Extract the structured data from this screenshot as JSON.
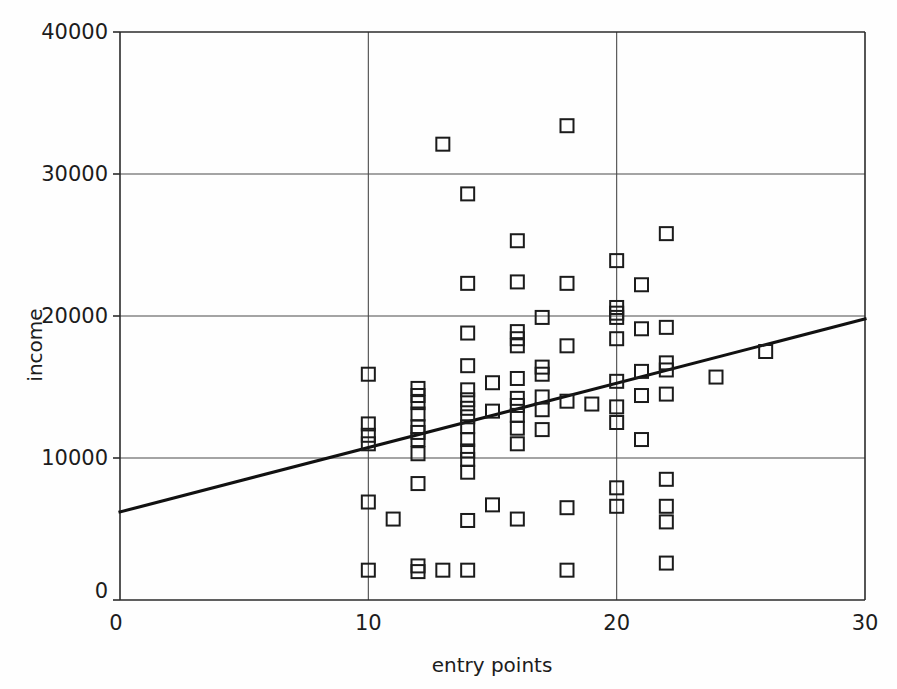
{
  "chart_data": {
    "type": "scatter",
    "title": "",
    "xlabel": "entry points",
    "ylabel": "income",
    "xlim": [
      0,
      30
    ],
    "ylim": [
      0,
      40000
    ],
    "xticks": [
      0,
      10,
      20,
      30
    ],
    "xtick_labels": [
      "0",
      "10",
      "20",
      "30"
    ],
    "yticks": [
      0,
      10000,
      20000,
      30000,
      40000
    ],
    "ytick_labels": [
      "0",
      "10000",
      "20000",
      "30000",
      "40000"
    ],
    "grid": true,
    "grid_description": "horizontal gridlines at 10000, 20000, 30000; vertical gridlines at 10 and 20",
    "legend": null,
    "marker_style": "open square",
    "series": [
      {
        "name": "observations",
        "points": [
          [
            10,
            2100
          ],
          [
            10,
            6900
          ],
          [
            10,
            11000
          ],
          [
            10,
            11600
          ],
          [
            10,
            12400
          ],
          [
            10,
            15900
          ],
          [
            11,
            5700
          ],
          [
            12,
            2000
          ],
          [
            12,
            2400
          ],
          [
            12,
            8200
          ],
          [
            12,
            10300
          ],
          [
            12,
            11300
          ],
          [
            12,
            11800
          ],
          [
            12,
            12200
          ],
          [
            12,
            13100
          ],
          [
            12,
            13900
          ],
          [
            12,
            14400
          ],
          [
            12,
            14900
          ],
          [
            13,
            2100
          ],
          [
            13,
            32100
          ],
          [
            14,
            2100
          ],
          [
            14,
            5600
          ],
          [
            14,
            9000
          ],
          [
            14,
            9900
          ],
          [
            14,
            10500
          ],
          [
            14,
            11300
          ],
          [
            14,
            12200
          ],
          [
            14,
            12900
          ],
          [
            14,
            13500
          ],
          [
            14,
            14100
          ],
          [
            14,
            14800
          ],
          [
            14,
            16500
          ],
          [
            14,
            18800
          ],
          [
            14,
            22300
          ],
          [
            14,
            28600
          ],
          [
            15,
            6700
          ],
          [
            15,
            13300
          ],
          [
            15,
            15300
          ],
          [
            16,
            5700
          ],
          [
            16,
            11000
          ],
          [
            16,
            12100
          ],
          [
            16,
            13000
          ],
          [
            16,
            13700
          ],
          [
            16,
            14200
          ],
          [
            16,
            15600
          ],
          [
            16,
            17900
          ],
          [
            16,
            18400
          ],
          [
            16,
            18900
          ],
          [
            16,
            22400
          ],
          [
            16,
            25300
          ],
          [
            17,
            12000
          ],
          [
            17,
            13400
          ],
          [
            17,
            14300
          ],
          [
            17,
            15900
          ],
          [
            17,
            16400
          ],
          [
            17,
            19900
          ],
          [
            18,
            2100
          ],
          [
            18,
            6500
          ],
          [
            18,
            14000
          ],
          [
            18,
            17900
          ],
          [
            18,
            22300
          ],
          [
            18,
            33400
          ],
          [
            19,
            13800
          ],
          [
            20,
            6600
          ],
          [
            20,
            7900
          ],
          [
            20,
            12500
          ],
          [
            20,
            13600
          ],
          [
            20,
            15400
          ],
          [
            20,
            18400
          ],
          [
            20,
            19900
          ],
          [
            20,
            20200
          ],
          [
            20,
            20600
          ],
          [
            20,
            23900
          ],
          [
            21,
            11300
          ],
          [
            21,
            14400
          ],
          [
            21,
            16100
          ],
          [
            21,
            19100
          ],
          [
            21,
            22200
          ],
          [
            22,
            2600
          ],
          [
            22,
            5500
          ],
          [
            22,
            6600
          ],
          [
            22,
            8500
          ],
          [
            22,
            14500
          ],
          [
            22,
            16200
          ],
          [
            22,
            16700
          ],
          [
            22,
            19200
          ],
          [
            22,
            25800
          ],
          [
            24,
            15700
          ],
          [
            26,
            17500
          ]
        ]
      }
    ],
    "fit_line": {
      "name": "regression line",
      "x0": 0,
      "y0": 6200,
      "x1": 30,
      "y1": 19800
    }
  },
  "axes": {
    "x_title": "entry points",
    "y_title": "income"
  }
}
